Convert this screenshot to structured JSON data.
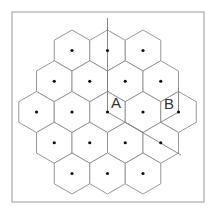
{
  "diagram": {
    "title": "",
    "colors": {
      "frame": "#9a9a9a",
      "hex_stroke": "#8c8c8c",
      "guide_line": "#7a7a7a",
      "dot": "#111111",
      "label": "#333333"
    },
    "frame": {
      "x": 12,
      "y": 12,
      "width": 192,
      "height": 190
    },
    "hex": {
      "radius": 20.5,
      "orientation": "pointy-top"
    },
    "cells": [
      {
        "cx": 72,
        "cy": 50.5
      },
      {
        "cx": 107.5,
        "cy": 50.5
      },
      {
        "cx": 143,
        "cy": 50.5
      },
      {
        "cx": 54.25,
        "cy": 81.25
      },
      {
        "cx": 89.75,
        "cy": 81.25
      },
      {
        "cx": 125.25,
        "cy": 81.25
      },
      {
        "cx": 160.75,
        "cy": 81.25
      },
      {
        "cx": 36.5,
        "cy": 112
      },
      {
        "cx": 72,
        "cy": 112
      },
      {
        "cx": 107.5,
        "cy": 112,
        "label": "A"
      },
      {
        "cx": 143,
        "cy": 112
      },
      {
        "cx": 178.5,
        "cy": 112,
        "label": "B"
      },
      {
        "cx": 54.25,
        "cy": 142.75
      },
      {
        "cx": 89.75,
        "cy": 142.75
      },
      {
        "cx": 125.25,
        "cy": 142.75
      },
      {
        "cx": 160.75,
        "cy": 142.75
      },
      {
        "cx": 72,
        "cy": 173.5
      },
      {
        "cx": 107.5,
        "cy": 173.5
      },
      {
        "cx": 143,
        "cy": 173.5
      }
    ],
    "labels": {
      "A": {
        "text": "A",
        "x": 111,
        "y": 108
      },
      "B": {
        "text": "B",
        "x": 164,
        "y": 109
      }
    },
    "guide_lines": [
      {
        "x1": 107.5,
        "y1": 18,
        "x2": 107.5,
        "y2": 112
      },
      {
        "x1": 107.5,
        "y1": 112,
        "x2": 181,
        "y2": 155
      },
      {
        "x1": 178.5,
        "y1": 88,
        "x2": 178.5,
        "y2": 112
      },
      {
        "x1": 178.5,
        "y1": 112,
        "x2": 160.75,
        "y2": 122.25
      }
    ]
  }
}
